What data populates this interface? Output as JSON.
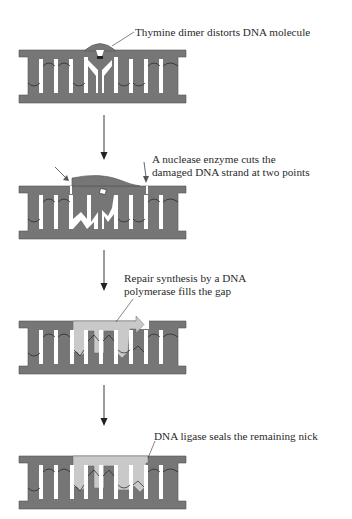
{
  "colors": {
    "dna_strand": "#767676",
    "new_strand": "#c9c9c9",
    "outline": "#4a4a4a",
    "base_gap": "#ffffff",
    "arrow": "#222222",
    "text": "#2a2a2a"
  },
  "steps": [
    {
      "id": "step1",
      "label_lines": [
        "Thymine dimer distorts DNA molecule"
      ]
    },
    {
      "id": "step2",
      "label_lines": [
        "A nuclease enzyme cuts the",
        "damaged DNA strand at two points"
      ]
    },
    {
      "id": "step3",
      "label_lines": [
        "Repair synthesis by a DNA",
        "polymerase fills the gap"
      ]
    },
    {
      "id": "step4",
      "label_lines": [
        "DNA ligase seals the remaining nick"
      ]
    }
  ]
}
